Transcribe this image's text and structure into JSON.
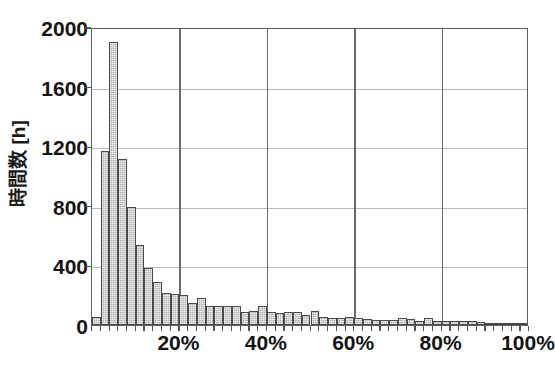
{
  "chart_data": {
    "type": "bar",
    "title": "",
    "subtitle": "",
    "xlabel": "",
    "ylabel": "時間数 [h]",
    "ylabel_text": "時間数 [h]",
    "xlim": [
      0,
      100
    ],
    "ylim": [
      0,
      2000
    ],
    "grid": "horizontal-and-vertical",
    "legend": "none",
    "y_ticks": [
      {
        "value": 2000,
        "label": "2000"
      },
      {
        "value": 1600,
        "label": "1600"
      },
      {
        "value": 1200,
        "label": "1200"
      },
      {
        "value": 800,
        "label": "800"
      },
      {
        "value": 400,
        "label": "400"
      },
      {
        "value": 0,
        "label": "0"
      }
    ],
    "x_ticks": [
      {
        "value": 20,
        "label": "20%"
      },
      {
        "value": 40,
        "label": "40%"
      },
      {
        "value": 60,
        "label": "60%"
      },
      {
        "value": 80,
        "label": "80%"
      },
      {
        "value": 100,
        "label": "100%"
      }
    ],
    "x_unit": "%",
    "y_unit": "h",
    "bin_width": 2,
    "bin_start": 0,
    "bar_fill_color": "#b0b0b0",
    "bar_edge_color": "#4a4a4a",
    "axis_color": "#5d5d5d",
    "gridline_color": "#b9b9b9",
    "categories": [
      "0-2%",
      "2-4%",
      "4-6%",
      "6-8%",
      "8-10%",
      "10-12%",
      "12-14%",
      "14-16%",
      "16-18%",
      "18-20%",
      "20-22%",
      "22-24%",
      "24-26%",
      "26-28%",
      "28-30%",
      "30-32%",
      "32-34%",
      "34-36%",
      "36-38%",
      "38-40%",
      "40-42%",
      "42-44%",
      "44-46%",
      "46-48%",
      "48-50%",
      "50-52%",
      "52-54%",
      "54-56%",
      "56-58%",
      "58-60%",
      "60-62%",
      "62-64%",
      "64-66%",
      "66-68%",
      "68-70%",
      "70-72%",
      "72-74%",
      "74-76%",
      "76-78%",
      "78-80%",
      "80-82%",
      "82-84%",
      "84-86%",
      "86-88%",
      "88-90%",
      "90-92%",
      "92-94%",
      "94-96%",
      "96-98%",
      "98-100%"
    ],
    "values": [
      55,
      1165,
      1900,
      1115,
      795,
      535,
      385,
      290,
      215,
      205,
      200,
      145,
      180,
      130,
      125,
      125,
      125,
      90,
      95,
      125,
      90,
      80,
      85,
      85,
      70,
      95,
      55,
      45,
      50,
      55,
      50,
      40,
      35,
      35,
      35,
      50,
      40,
      30,
      50,
      30,
      25,
      25,
      25,
      25,
      20,
      8,
      8,
      8,
      8,
      12
    ]
  }
}
